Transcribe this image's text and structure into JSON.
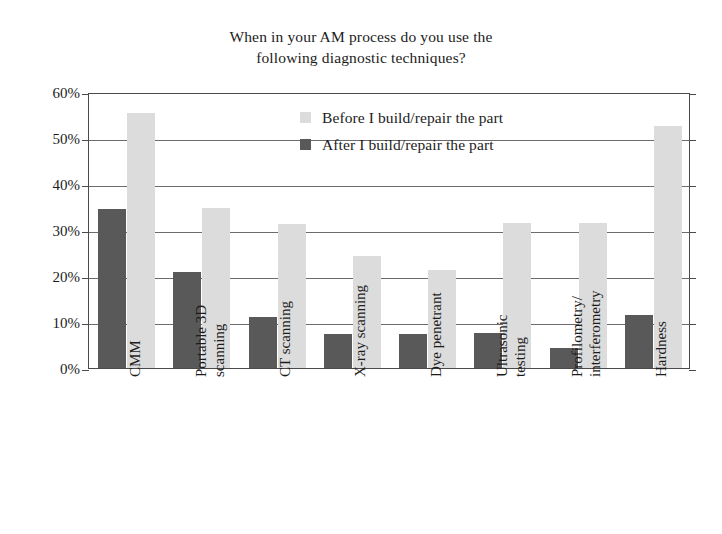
{
  "chart_data": {
    "type": "bar",
    "title": "When in your AM process do you use the following diagnostic techniques?",
    "title_lines": [
      "When in your AM process do you use the",
      "following diagnostic techniques?"
    ],
    "xlabel": "",
    "ylabel": "",
    "ylim": [
      0,
      60
    ],
    "ytick_values": [
      0,
      10,
      20,
      30,
      40,
      50,
      60
    ],
    "ytick_labels": [
      "0%",
      "10%",
      "20%",
      "30%",
      "40%",
      "50%",
      "60%"
    ],
    "grid": true,
    "legend_position": "inside-top-center",
    "categories": [
      "CMM",
      "Portable 3D scanning",
      "CT scanning",
      "X-ray scanning",
      "Dye penetrant",
      "Ultrasonic testing",
      "Profilometry/ interferometry",
      "Hardness"
    ],
    "category_label_lines": [
      [
        "CMM"
      ],
      [
        "Portable 3D",
        "scanning"
      ],
      [
        "CT scanning"
      ],
      [
        "X-ray scanning"
      ],
      [
        "Dye penetrant"
      ],
      [
        "Ultrasonic",
        "testing"
      ],
      [
        "Profilometry/",
        "interferometry"
      ],
      [
        "Hardness"
      ]
    ],
    "series": [
      {
        "name": "After I build/repair the part",
        "color": "#595959",
        "values": [
          34.5,
          20.9,
          11.0,
          7.4,
          7.5,
          7.7,
          4.3,
          11.5
        ]
      },
      {
        "name": "Before I build/repair the part",
        "color": "#dcdcdc",
        "values": [
          55.5,
          34.8,
          31.4,
          24.3,
          21.2,
          31.6,
          31.5,
          52.7
        ]
      }
    ]
  },
  "legend": {
    "entries": [
      {
        "label": "Before I build/repair the part",
        "swatch": "before"
      },
      {
        "label": "After I build/repair the part",
        "swatch": "after"
      }
    ]
  },
  "colors": {
    "before_bar": "#dcdcdc",
    "after_bar": "#595959",
    "axis": "#4a4a4a",
    "gridline": "#6b6b6b",
    "text": "#1c1c1c",
    "background": "#ffffff"
  }
}
